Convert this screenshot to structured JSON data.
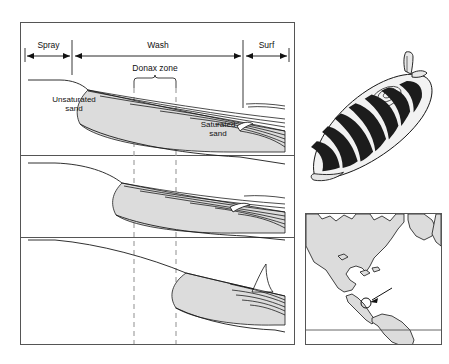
{
  "figure": {
    "type": "scientific-diagram"
  },
  "profile_panels": {
    "zone_labels": [
      {
        "name": "spray",
        "label": "Spray"
      },
      {
        "name": "wash",
        "label": "Wash"
      },
      {
        "name": "surf",
        "label": "Surf"
      }
    ],
    "donax_zone_label": "Donax zone",
    "sand_labels": {
      "unsaturated": "Unsaturated\nsand",
      "unsaturated_line1": "Unsaturated",
      "unsaturated_line2": "sand",
      "saturated_line1": "Saturated",
      "saturated_line2": "sand"
    },
    "panel_count": 3
  },
  "colors": {
    "sand_fill": "#dcdcdc",
    "line": "#1a1a1a",
    "frame": "#555555",
    "dashed_guide": "#9a9a9a",
    "map_land": "#dcdcdc",
    "shell_dark": "#1c1c1c",
    "background": "#ffffff"
  },
  "shell_illustration": {
    "name": "donax-clam-shell",
    "band_count": 11,
    "has_siphon": true
  },
  "map_inset": {
    "name": "americas-distribution-map",
    "has_equator_line": true,
    "has_location_marker": true,
    "marker_style": "arrow-to-circle"
  }
}
